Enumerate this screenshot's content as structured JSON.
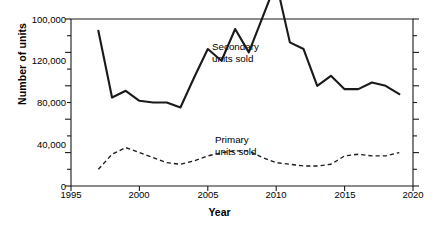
{
  "chart_data": {
    "type": "line",
    "title": "",
    "xlabel": "Year",
    "ylabel": "Number of units",
    "xlim": [
      1995,
      2020
    ],
    "ylim": [
      0,
      100000
    ],
    "grid": false,
    "legend_position": "inline-annotations",
    "x_tick_labels": [
      "1995",
      "2000",
      "2005",
      "2010",
      "2015",
      "2020"
    ],
    "x_tick_values": [
      1995,
      2000,
      2005,
      2010,
      2015,
      2020
    ],
    "y_tick_labels": [
      "0",
      "40,000",
      "80,000",
      "120,000",
      "100,000"
    ],
    "y_tick_values": [
      0,
      20000,
      40000,
      60000,
      80000,
      100000
    ],
    "y_major_labeled_positions": [
      0,
      40000,
      80000,
      100000
    ],
    "y_axis_note": "Axis labels appear out of order as drawn: from top they read 100,000 / 120,000 / 80,000 / 40,000 / 0",
    "annotations": [
      {
        "id": "secondary",
        "line1": "Secondary",
        "line2": "units sold"
      },
      {
        "id": "primary",
        "line1": "Primary",
        "line2": "units sold"
      }
    ],
    "x": [
      1997,
      1998,
      1999,
      2000,
      2001,
      2002,
      2003,
      2004,
      2005,
      2006,
      2007,
      2008,
      2009,
      2010,
      2011,
      2012,
      2013,
      2014,
      2015,
      2016,
      2017,
      2018,
      2019
    ],
    "series": [
      {
        "name": "Secondary units sold",
        "style": "solid",
        "color": "#1a1a1a",
        "values": [
          93000,
          53000,
          57000,
          51000,
          50000,
          50000,
          47000,
          65000,
          82000,
          75000,
          94000,
          80000,
          101000,
          122000,
          86000,
          82000,
          60000,
          66000,
          58000,
          58000,
          62000,
          60000,
          55000
        ]
      },
      {
        "name": "Primary units sold",
        "style": "dashed",
        "color": "#1a1a1a",
        "values": [
          10000,
          19000,
          23000,
          20000,
          17000,
          14000,
          13000,
          15000,
          18000,
          20000,
          21000,
          21000,
          17000,
          14000,
          13000,
          12000,
          12000,
          13000,
          18000,
          19000,
          18000,
          18000,
          20000
        ]
      }
    ]
  }
}
